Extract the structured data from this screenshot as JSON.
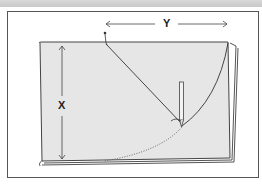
{
  "figure": {
    "type": "illustration",
    "labels": {
      "horizontal_dimension": "Y",
      "vertical_dimension": "X"
    },
    "colors": {
      "fabric_fill": "#e6e6e6",
      "outline": "#444444",
      "frame_border": "#555555",
      "top_band": "#cccccc"
    }
  }
}
